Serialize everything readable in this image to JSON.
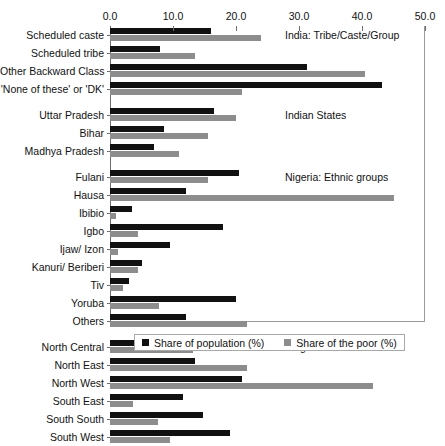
{
  "chart_data": {
    "type": "bar",
    "orientation": "horizontal",
    "title": "",
    "xlabel": "",
    "ylabel": "",
    "xlim": [
      0.0,
      50.0
    ],
    "xticks": [
      "0.0",
      "10.0",
      "20.0",
      "30.0",
      "40.0",
      "50.0"
    ],
    "xtick_values": [
      0.0,
      10.0,
      20.0,
      30.0,
      40.0,
      50.0
    ],
    "grid": false,
    "legend_position": "bottom",
    "series": [
      {
        "name": "Share of population (%)",
        "color": "#111111"
      },
      {
        "name": "Share of the poor (%)",
        "color": "#8d8d8d"
      }
    ],
    "sections": [
      {
        "note": "India: Tribe/Caste/Group",
        "categories": [
          "Scheduled caste",
          "Scheduled tribe",
          "Other Backward Class",
          "'None of these' or 'DK'"
        ],
        "share_of_population": [
          16.0,
          8.0,
          31.3,
          43.2
        ],
        "share_of_the_poor": [
          24.0,
          13.5,
          40.5,
          21.0
        ]
      },
      {
        "note": "Indian States",
        "categories": [
          "Uttar Pradesh",
          "Bihar",
          "Madhya Pradesh"
        ],
        "share_of_population": [
          16.5,
          8.5,
          7.0
        ],
        "share_of_the_poor": [
          20.0,
          15.5,
          11.0
        ]
      },
      {
        "note": "Nigeria: Ethnic groups",
        "categories": [
          "Fulani",
          "Hausa",
          "Ibibio",
          "Igbo",
          "Ijaw/ Izon",
          "Kanuri/ Beriberi",
          "Tiv",
          "Yoruba",
          "Others"
        ],
        "share_of_population": [
          20.5,
          12.0,
          3.5,
          18.0,
          9.5,
          5.0,
          3.0,
          20.0,
          12.0
        ],
        "share_of_the_poor": [
          15.5,
          45.0,
          1.0,
          4.5,
          1.2,
          4.5,
          2.0,
          7.8,
          21.8
        ]
      },
      {
        "note": "Nigerian Zones",
        "categories": [
          "North Central",
          "North East",
          "North West",
          "South East",
          "South South",
          "South West"
        ],
        "share_of_population": [
          18.5,
          13.5,
          21.0,
          11.6,
          14.7,
          19.0
        ],
        "share_of_the_poor": [
          13.2,
          21.8,
          41.7,
          3.6,
          7.6,
          9.5
        ]
      }
    ]
  }
}
